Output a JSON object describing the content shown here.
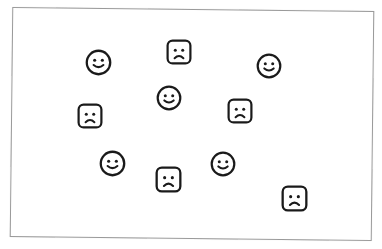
{
  "canvas": {
    "border_color": "#9a9a9a",
    "icon_color": "#1a1a1a"
  },
  "icons": [
    {
      "type": "smiley",
      "cx": 98,
      "cy": 62,
      "size": 27
    },
    {
      "type": "sad",
      "cx": 179,
      "cy": 52,
      "size": 26
    },
    {
      "type": "smiley",
      "cx": 269,
      "cy": 66,
      "size": 26
    },
    {
      "type": "smiley",
      "cx": 169,
      "cy": 98,
      "size": 26
    },
    {
      "type": "sad",
      "cx": 90,
      "cy": 116,
      "size": 26
    },
    {
      "type": "sad",
      "cx": 240,
      "cy": 111,
      "size": 26
    },
    {
      "type": "smiley",
      "cx": 112,
      "cy": 163,
      "size": 27
    },
    {
      "type": "sad",
      "cx": 168,
      "cy": 179,
      "size": 27
    },
    {
      "type": "smiley",
      "cx": 223,
      "cy": 164,
      "size": 26
    },
    {
      "type": "sad",
      "cx": 294,
      "cy": 198,
      "size": 27
    }
  ]
}
